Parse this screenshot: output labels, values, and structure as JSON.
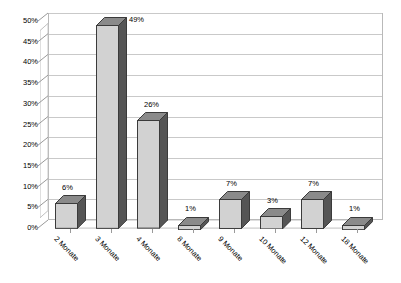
{
  "chart_data": {
    "type": "bar",
    "title": "",
    "subtitle": "",
    "xlabel": "",
    "ylabel": "",
    "categories": [
      "2 Monate",
      "3 Monate",
      "4 Monate",
      "8 Monate",
      "9 Monate",
      "10 Monate",
      "12 Monate",
      "18 Monate"
    ],
    "values": [
      6,
      49,
      26,
      1,
      7,
      3,
      7,
      1
    ],
    "data_labels": [
      "6%",
      "49%",
      "26%",
      "1%",
      "7%",
      "3%",
      "7%",
      "1%"
    ],
    "ylim": [
      0,
      50
    ],
    "ytick_values": [
      0,
      5,
      10,
      15,
      20,
      25,
      30,
      35,
      40,
      45,
      50
    ],
    "ytick_labels": [
      "0%",
      "5%",
      "10%",
      "15%",
      "20%",
      "25%",
      "30%",
      "35%",
      "40%",
      "45%",
      "50%"
    ],
    "grid": true,
    "legend": false,
    "legend_position": "none",
    "style": "3d-column",
    "colors": {
      "bar_front": "#d2d2d2",
      "bar_side": "#555555",
      "bar_top": "#8a8a8a",
      "bar_outline": "#3b3b3b",
      "gridline": "#c9c9c9",
      "axis": "#9a9a9a",
      "plot_border": "#b9b9b9",
      "background": "#ffffff",
      "text": "#000000"
    }
  }
}
